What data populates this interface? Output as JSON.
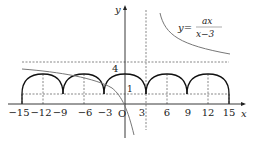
{
  "diagram": {
    "axes": {
      "x_label": "x",
      "y_label": "y",
      "origin_label": "O"
    },
    "x_ticks": [
      "−15",
      "−12",
      "−9",
      "−6",
      "−3",
      "3",
      "6",
      "9",
      "12",
      "15"
    ],
    "y_ticks": [
      "1",
      "4"
    ],
    "curve_label": {
      "lhs": "y=",
      "numerator": "ax",
      "denominator": "x−3"
    },
    "colors": {
      "axis": "#222222",
      "arcs": "#111111",
      "hyperbola": "#777777",
      "dashed": "#555555"
    }
  }
}
